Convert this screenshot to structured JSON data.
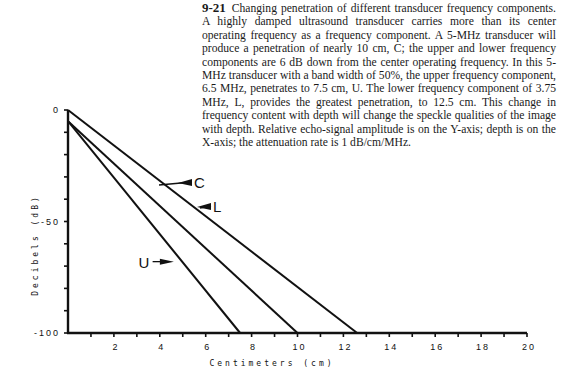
{
  "caption": {
    "figure_number": "9-21",
    "text": "Changing penetration of different transducer frequency components. A highly damped ultrasound transducer carries more than its center operating frequency as a frequency component. A 5-MHz transducer will produce a penetration of nearly 10 cm, C; the upper and lower frequency components are 6 dB down from the center operating frequency. In this 5-MHz transducer with a band width of 50%, the upper frequency component, 6.5 MHz, penetrates to 7.5 cm, U. The lower frequency component of 3.75 MHz, L, provides the greatest penetration, to 12.5 cm. This change in frequency content with depth will change the speckle qualities of the image with depth. Relative echo-signal amplitude is on the Y-axis; depth is on the X-axis; the attenuation rate is 1 dB/cm/MHz."
  },
  "chart_data": {
    "type": "line",
    "title": "",
    "xlabel": "Centimeters (cm)",
    "ylabel": "Decibels (dB)",
    "xlim": [
      0,
      20
    ],
    "ylim": [
      -100,
      0
    ],
    "x_ticks": [
      2,
      4,
      6,
      8,
      10,
      12,
      14,
      16,
      18,
      20
    ],
    "x_minor_tick_step": 1,
    "y_ticks": [
      0,
      -50,
      -100
    ],
    "y_minor_tick_step": 10,
    "grid": false,
    "legend": "inline arrow labels",
    "series": [
      {
        "name": "L",
        "description": "lower frequency component 3.75 MHz",
        "x": [
          0,
          12.6
        ],
        "y": [
          0,
          -100
        ]
      },
      {
        "name": "C",
        "description": "center frequency 5 MHz",
        "x": [
          0,
          10.0
        ],
        "y": [
          -5,
          -100
        ]
      },
      {
        "name": "U",
        "description": "upper frequency component 6.5 MHz",
        "x": [
          0,
          7.5
        ],
        "y": [
          -5,
          -100
        ]
      }
    ],
    "annotations": [
      {
        "label": "C",
        "x": 4.4,
        "y": -38
      },
      {
        "label": "L",
        "x": 6.1,
        "y": -47
      },
      {
        "label": "U",
        "x": 3.6,
        "y": -68
      }
    ]
  }
}
